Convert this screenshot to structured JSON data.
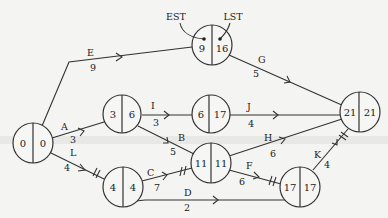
{
  "diagram": {
    "type": "activity-network",
    "annotations": {
      "est_label": "EST",
      "lst_label": "LST"
    },
    "nodes": [
      {
        "id": "n0",
        "est": "0",
        "lst": "0"
      },
      {
        "id": "n1",
        "est": "3",
        "lst": "6"
      },
      {
        "id": "n2",
        "est": "9",
        "lst": "16"
      },
      {
        "id": "n3",
        "est": "6",
        "lst": "17"
      },
      {
        "id": "n4",
        "est": "4",
        "lst": "4"
      },
      {
        "id": "n5",
        "est": "11",
        "lst": "11"
      },
      {
        "id": "n6",
        "est": "17",
        "lst": "17"
      },
      {
        "id": "n7",
        "est": "21",
        "lst": "21"
      }
    ],
    "edges": [
      {
        "activity": "E",
        "duration": "9",
        "from": "n0",
        "to": "n2",
        "critical": false
      },
      {
        "activity": "A",
        "duration": "3",
        "from": "n0",
        "to": "n1",
        "critical": false
      },
      {
        "activity": "L",
        "duration": "4",
        "from": "n0",
        "to": "n4",
        "critical": true
      },
      {
        "activity": "G",
        "duration": "5",
        "from": "n2",
        "to": "n7",
        "critical": false
      },
      {
        "activity": "I",
        "duration": "3",
        "from": "n1",
        "to": "n3",
        "critical": false
      },
      {
        "activity": "B",
        "duration": "5",
        "from": "n1",
        "to": "n5",
        "critical": false
      },
      {
        "activity": "J",
        "duration": "4",
        "from": "n3",
        "to": "n7",
        "critical": false
      },
      {
        "activity": "C",
        "duration": "7",
        "from": "n4",
        "to": "n5",
        "critical": true
      },
      {
        "activity": "D",
        "duration": "2",
        "from": "n4",
        "to": "n6",
        "critical": false
      },
      {
        "activity": "H",
        "duration": "6",
        "from": "n5",
        "to": "n7",
        "critical": false
      },
      {
        "activity": "F",
        "duration": "6",
        "from": "n5",
        "to": "n6",
        "critical": true
      },
      {
        "activity": "K",
        "duration": "4",
        "from": "n6",
        "to": "n7",
        "critical": true
      }
    ]
  }
}
